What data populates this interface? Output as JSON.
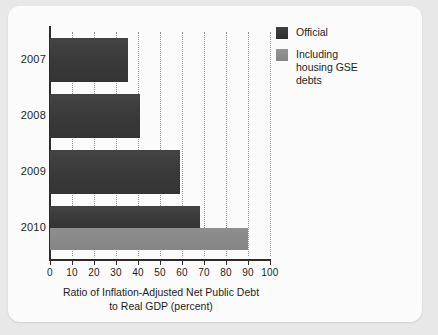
{
  "chart_data": {
    "type": "bar",
    "orientation": "horizontal",
    "title": "",
    "xlabel": "Ratio of Inflation-Adjusted Net Public Debt to Real GDP (percent)",
    "xlabel_line1": "Ratio of Inflation-Adjusted Net Public Debt",
    "xlabel_line2": "to Real GDP (percent)",
    "ylabel": "",
    "categories": [
      "2007",
      "2008",
      "2009",
      "2010"
    ],
    "series": [
      {
        "name": "Official",
        "color": "#3a3a3a",
        "values": [
          35.5,
          41,
          59,
          68
        ]
      },
      {
        "name": "Including housing GSE debts",
        "color": "#8a8a8a",
        "values": [
          null,
          null,
          null,
          90
        ]
      }
    ],
    "xlim": [
      0,
      100
    ],
    "xticks": [
      0,
      10,
      20,
      30,
      40,
      50,
      60,
      70,
      80,
      90,
      100
    ],
    "xtick_labels": [
      "0",
      "10",
      "20",
      "30",
      "40",
      "50",
      "60",
      "70",
      "80",
      "90",
      "100"
    ],
    "grid": "vertical-dotted",
    "legend_position": "top-right",
    "legend": [
      {
        "label": "Official",
        "label_lines": [
          "Official"
        ],
        "color": "#3a3a3a"
      },
      {
        "label": "Including housing GSE debts",
        "label_lines": [
          "Including",
          "housing GSE",
          "debts"
        ],
        "color": "#8a8a8a"
      }
    ]
  },
  "figure": {
    "background": "#e8e8e8",
    "card_background": "#fbfbfb",
    "axis_color": "#2b2b2b",
    "grid_color": "#8d8d8d"
  }
}
